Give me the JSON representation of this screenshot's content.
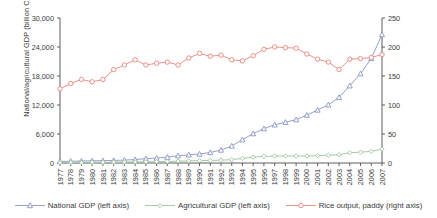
{
  "chart_data": {
    "type": "line",
    "title": "",
    "xlabel": "",
    "ylabel": "National/agricultural GDP (billion CN¥)",
    "y2label": "Rice output (million tonnes)",
    "ylim": [
      0,
      30000
    ],
    "y2lim": [
      0,
      250
    ],
    "yticks": [
      "0",
      "6,000",
      "12,000",
      "18,000",
      "24,000",
      "30,000"
    ],
    "ytick_values": [
      0,
      6000,
      12000,
      18000,
      24000,
      30000
    ],
    "y2ticks": [
      "0",
      "50",
      "100",
      "150",
      "200",
      "250"
    ],
    "y2tick_values": [
      0,
      50,
      100,
      150,
      200,
      250
    ],
    "grid": false,
    "legend_position": "bottom",
    "x": [
      1977,
      1978,
      1979,
      1980,
      1981,
      1982,
      1983,
      1984,
      1985,
      1986,
      1987,
      1988,
      1989,
      1990,
      1991,
      1992,
      1993,
      1994,
      1995,
      1996,
      1997,
      1998,
      1999,
      2000,
      2001,
      2002,
      2003,
      2004,
      2005,
      2006,
      2007
    ],
    "categories": [
      "1977",
      "1978",
      "1979",
      "1980",
      "1981",
      "1982",
      "1983",
      "1984",
      "1985",
      "1986",
      "1987",
      "1988",
      "1989",
      "1990",
      "1991",
      "1992",
      "1993",
      "1994",
      "1995",
      "1996",
      "1997",
      "1998",
      "1999",
      "2000",
      "2001",
      "2002",
      "2003",
      "2004",
      "2005",
      "2006",
      "2007"
    ],
    "series": [
      {
        "name": "National GDP (left axis)",
        "axis": "left",
        "color": "#8a95c4",
        "marker": "triangle",
        "unit": "billion CN¥",
        "values": [
          325,
          365,
          406,
          455,
          490,
          533,
          597,
          721,
          902,
          1028,
          1205,
          1504,
          1699,
          1866,
          2178,
          2692,
          3533,
          4820,
          6079,
          7118,
          7897,
          8440,
          8968,
          9921,
          10966,
          12033,
          13582,
          15988,
          18494,
          21631,
          26581
        ]
      },
      {
        "name": "Agricultural GDP (left axis)",
        "axis": "left",
        "color": "#9cc49a",
        "marker": "diamond",
        "unit": "billion CN¥",
        "values": [
          94,
          102,
          126,
          136,
          156,
          178,
          197,
          229,
          254,
          276,
          320,
          383,
          423,
          502,
          529,
          580,
          688,
          947,
          1200,
          1385,
          1425,
          1462,
          1447,
          1463,
          1539,
          1607,
          1701,
          2141,
          2242,
          2404,
          2863
        ]
      },
      {
        "name": "Rice output, paddy (right axis)",
        "axis": "right",
        "color": "#e8877c",
        "marker": "circle",
        "unit": "million tonnes",
        "values": [
          128,
          137,
          144,
          140,
          144,
          161,
          169,
          178,
          169,
          172,
          174,
          169,
          181,
          189,
          184,
          186,
          178,
          176,
          185,
          196,
          200,
          199,
          198,
          188,
          179,
          174,
          161,
          179,
          180,
          182,
          187
        ]
      }
    ]
  },
  "legend": {
    "items": [
      {
        "label": "National GDP (left axis)"
      },
      {
        "label": "Agricultural GDP (left axis)"
      },
      {
        "label": "Rice output, paddy (right axis)"
      }
    ]
  }
}
